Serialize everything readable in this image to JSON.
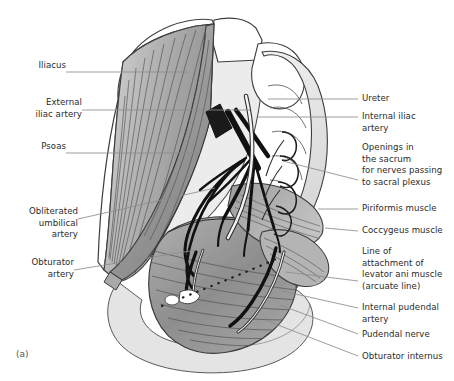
{
  "figure": {
    "caption": "(a)",
    "background_color": "#ffffff",
    "text_color": "#2b2b2b",
    "leader_color": "#8d8d8d",
    "outline_color": "#3a3a3a",
    "vessel_color": "#111111",
    "palette": {
      "muscle_mid": "#9a9a9a",
      "muscle_dark": "#7c7c7c",
      "muscle_light": "#c2c2c2",
      "bone_light": "#dcdcdc",
      "bone_white": "#ffffff",
      "striation": "#4a4a4a"
    }
  },
  "labels_left": [
    {
      "id": "iliacus",
      "text": "Iliacus",
      "x": 26,
      "y": 66,
      "leader": {
        "x1": 66,
        "y1": 72,
        "x2": 188,
        "y2": 72
      }
    },
    {
      "id": "external-iliac-artery",
      "text": "External\niliac artery",
      "x": 15,
      "y": 103,
      "leader": {
        "x1": 82,
        "y1": 110,
        "x2": 250,
        "y2": 110
      }
    },
    {
      "id": "psoas",
      "text": "Psoas",
      "x": 29,
      "y": 147,
      "leader": {
        "x1": 66,
        "y1": 153,
        "x2": 200,
        "y2": 153
      }
    },
    {
      "id": "obliterated-umbilical-artery",
      "text": "Obliterated\numbilical\nartery",
      "x": 13,
      "y": 212,
      "leader": {
        "x1": 78,
        "y1": 219,
        "x2": 215,
        "y2": 188
      }
    },
    {
      "id": "obturator-artery",
      "text": "Obturator\nartery",
      "x": 20,
      "y": 263,
      "leader": {
        "x1": 74,
        "y1": 270,
        "x2": 196,
        "y2": 250
      }
    }
  ],
  "labels_right": [
    {
      "id": "ureter",
      "text": "Ureter",
      "x": 362,
      "y": 94,
      "leader": {
        "x1": 358,
        "y1": 99,
        "x2": 268,
        "y2": 99
      }
    },
    {
      "id": "internal-iliac-artery",
      "text": "Internal iliac\nartery",
      "x": 362,
      "y": 112,
      "leader": {
        "x1": 358,
        "y1": 117,
        "x2": 258,
        "y2": 117
      }
    },
    {
      "id": "sacral-openings",
      "text": "Openings in\nthe sacrum\nfor nerves passing\nto sacral plexus",
      "x": 362,
      "y": 143,
      "leader": {
        "x1": 358,
        "y1": 180,
        "x2": 283,
        "y2": 161
      }
    },
    {
      "id": "piriformis-muscle",
      "text": "Piriformis muscle",
      "x": 362,
      "y": 204,
      "leader": {
        "x1": 358,
        "y1": 209,
        "x2": 318,
        "y2": 209
      }
    },
    {
      "id": "coccygeus-muscle",
      "text": "Coccygeus muscle",
      "x": 362,
      "y": 226,
      "leader": {
        "x1": 358,
        "y1": 231,
        "x2": 325,
        "y2": 228
      }
    },
    {
      "id": "levator-ani-line",
      "text": "Line of\nattachment of\nlevator ani muscle\n(arcuate line)",
      "x": 362,
      "y": 247,
      "leader": {
        "x1": 358,
        "y1": 281,
        "x2": 286,
        "y2": 272
      }
    },
    {
      "id": "internal-pudendal-artery",
      "text": "Internal pudendal\nartery",
      "x": 362,
      "y": 303,
      "leader": {
        "x1": 358,
        "y1": 308,
        "x2": 282,
        "y2": 291
      }
    },
    {
      "id": "pudendal-nerve",
      "text": "Pudendal nerve",
      "x": 362,
      "y": 330,
      "leader": {
        "x1": 358,
        "y1": 334,
        "x2": 280,
        "y2": 305
      }
    },
    {
      "id": "obturator-internus",
      "text": "Obturator internus",
      "x": 362,
      "y": 352,
      "leader": {
        "x1": 358,
        "y1": 356,
        "x2": 265,
        "y2": 320
      }
    }
  ]
}
